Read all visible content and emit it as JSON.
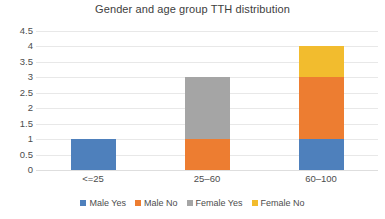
{
  "chart_data": {
    "type": "bar",
    "subtype": "stacked-column",
    "title": "Gender and age group TTH distribution",
    "xlabel": "",
    "ylabel": "",
    "categories": [
      "<=25",
      "25–60",
      "60–100"
    ],
    "series": [
      {
        "name": "Male Yes",
        "color": "#4e80bc",
        "values": [
          1,
          0,
          1
        ]
      },
      {
        "name": "Male No",
        "color": "#ed7d31",
        "values": [
          0,
          1,
          2
        ]
      },
      {
        "name": "Female Yes",
        "color": "#a5a5a5",
        "values": [
          0,
          2,
          0
        ]
      },
      {
        "name": "Female No",
        "color": "#f2bc2e",
        "values": [
          0,
          0,
          1
        ]
      }
    ],
    "totals": [
      1,
      3,
      4
    ],
    "ylim": [
      0,
      4.5
    ],
    "ytick_step": 0.5,
    "yticks": [
      "4.5",
      "4",
      "3.5",
      "3",
      "2.5",
      "2",
      "1.5",
      "1",
      "0.5",
      "0"
    ],
    "grid": true,
    "legend_position": "bottom"
  },
  "colors": {
    "background": "#ffffff",
    "gridline": "#e8e8e8",
    "text": "#404040",
    "tick_text": "#4d4d4d"
  }
}
